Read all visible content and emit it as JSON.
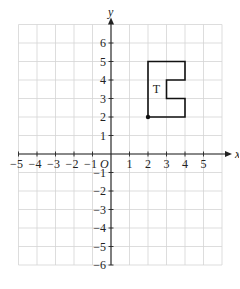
{
  "figure": {
    "type": "coordinate-plane",
    "axes": {
      "x_label": "x",
      "y_label": "y",
      "origin_label": "O",
      "x_ticks": [
        -5,
        -4,
        -3,
        -2,
        -1,
        1,
        2,
        3,
        4,
        5
      ],
      "y_ticks": [
        6,
        5,
        4,
        3,
        2,
        1,
        -1,
        -2,
        -3,
        -4,
        -5,
        -6
      ],
      "x_tick_labels": [
        "−5",
        "−4",
        "−3",
        "−2",
        "−1",
        "1",
        "2",
        "3",
        "4",
        "5"
      ],
      "y_tick_labels": [
        "6",
        "5",
        "4",
        "3",
        "2",
        "1",
        "−1",
        "−2",
        "−3",
        "−4",
        "−5",
        "−6"
      ],
      "grid_xrange": [
        -5,
        6
      ],
      "grid_yrange": [
        -6,
        7
      ]
    },
    "shape": {
      "label": "T",
      "vertices": [
        [
          2,
          2
        ],
        [
          2,
          5
        ],
        [
          4,
          5
        ],
        [
          4,
          4
        ],
        [
          3,
          4
        ],
        [
          3,
          3
        ],
        [
          4,
          3
        ],
        [
          4,
          2
        ]
      ],
      "marked_point": [
        2,
        2
      ],
      "stroke_color": "#111111"
    },
    "colors": {
      "grid": "#d4d4d4",
      "axis": "#222222",
      "background": "#ffffff"
    }
  }
}
